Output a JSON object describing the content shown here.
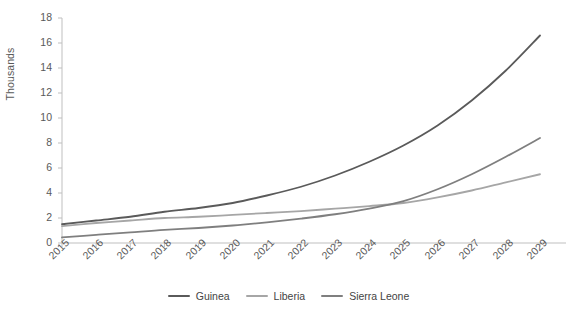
{
  "chart_data": {
    "type": "line",
    "title": "",
    "subtitle": "",
    "xlabel": "",
    "ylabel": "Thousands",
    "x": [
      2015,
      2016,
      2017,
      2018,
      2019,
      2020,
      2021,
      2022,
      2023,
      2024,
      2025,
      2026,
      2027,
      2028,
      2029
    ],
    "categories": [
      "2015",
      "2016",
      "2017",
      "2018",
      "2019",
      "2020",
      "2021",
      "2022",
      "2023",
      "2024",
      "2025",
      "2026",
      "2027",
      "2028",
      "2029"
    ],
    "xlim": [
      2015,
      2029
    ],
    "ylim": [
      0,
      18
    ],
    "yticks": [
      0,
      2,
      4,
      6,
      8,
      10,
      12,
      14,
      16,
      18
    ],
    "ytick_labels": [
      "0",
      "2",
      "4",
      "6",
      "8",
      "10",
      "12",
      "14",
      "16",
      "18"
    ],
    "grid": false,
    "legend_position": "bottom",
    "series": [
      {
        "name": "Guinea",
        "color": "#5a5a5a",
        "values": [
          1.5,
          1.8,
          2.1,
          2.5,
          2.8,
          3.2,
          3.8,
          4.5,
          5.4,
          6.5,
          7.8,
          9.4,
          11.4,
          13.8,
          16.6
        ]
      },
      {
        "name": "Liberia",
        "color": "#a6a6a6",
        "values": [
          1.35,
          1.6,
          1.8,
          2.0,
          2.1,
          2.25,
          2.4,
          2.55,
          2.75,
          2.95,
          3.2,
          3.65,
          4.2,
          4.85,
          5.5
        ]
      },
      {
        "name": "Sierra Leone",
        "color": "#7f7f7f",
        "values": [
          0.45,
          0.65,
          0.85,
          1.05,
          1.2,
          1.4,
          1.65,
          1.95,
          2.3,
          2.75,
          3.35,
          4.3,
          5.5,
          6.9,
          8.4
        ]
      }
    ]
  },
  "axis": {
    "line_color": "#bfbfbf",
    "tick_color": "#bfbfbf"
  },
  "legend": {
    "items": [
      {
        "label": "Guinea",
        "color": "#5a5a5a"
      },
      {
        "label": "Liberia",
        "color": "#a6a6a6"
      },
      {
        "label": "Sierra Leone",
        "color": "#7f7f7f"
      }
    ]
  }
}
